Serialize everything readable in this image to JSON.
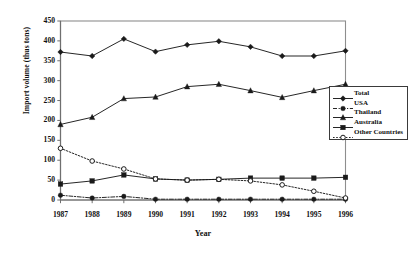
{
  "chart_data": {
    "type": "line",
    "title": "",
    "xlabel": "Year",
    "ylabel": "Import volume (thus tons)",
    "categories": [
      "1987",
      "1988",
      "1989",
      "1990",
      "1991",
      "1992",
      "1993",
      "1994",
      "1995",
      "1996"
    ],
    "x": [
      1987,
      1988,
      1989,
      1990,
      1991,
      1992,
      1993,
      1994,
      1995,
      1996
    ],
    "ylim": [
      0,
      450
    ],
    "yticks": [
      0,
      50,
      100,
      150,
      200,
      250,
      300,
      350,
      400,
      450
    ],
    "xlim": [
      1987,
      1996
    ],
    "grid": false,
    "legend_position": "right",
    "series": [
      {
        "name": "Total",
        "values": [
          372,
          362,
          405,
          373,
          390,
          399,
          385,
          362,
          362,
          375
        ],
        "marker": "filled-diamond",
        "line_style": "solid",
        "color": "#1a1a1a"
      },
      {
        "name": "USA",
        "values": [
          12,
          5,
          9,
          2,
          2,
          2,
          2,
          2,
          2,
          2
        ],
        "marker": "filled-circle",
        "line_style": "dash-dot",
        "color": "#1a1a1a"
      },
      {
        "name": "Thailand",
        "values": [
          190,
          208,
          255,
          259,
          285,
          291,
          275,
          258,
          275,
          291
        ],
        "marker": "filled-triangle",
        "line_style": "solid",
        "color": "#1a1a1a"
      },
      {
        "name": "Australia",
        "values": [
          40,
          48,
          63,
          53,
          50,
          52,
          55,
          55,
          55,
          57
        ],
        "marker": "filled-square",
        "line_style": "solid",
        "color": "#1a1a1a"
      },
      {
        "name": "Other Countries",
        "values": [
          130,
          98,
          78,
          53,
          50,
          52,
          48,
          38,
          22,
          5
        ],
        "marker": "open-circle",
        "line_style": "dotted",
        "color": "#1a1a1a"
      }
    ]
  },
  "axes": {
    "y_title": "Import volume (thus tons)",
    "x_title": "Year"
  },
  "legend": {
    "entries": [
      {
        "label": "Total"
      },
      {
        "label": "USA"
      },
      {
        "label": "Thailand"
      },
      {
        "label": "Australia"
      },
      {
        "label": "Other Countries"
      }
    ]
  }
}
